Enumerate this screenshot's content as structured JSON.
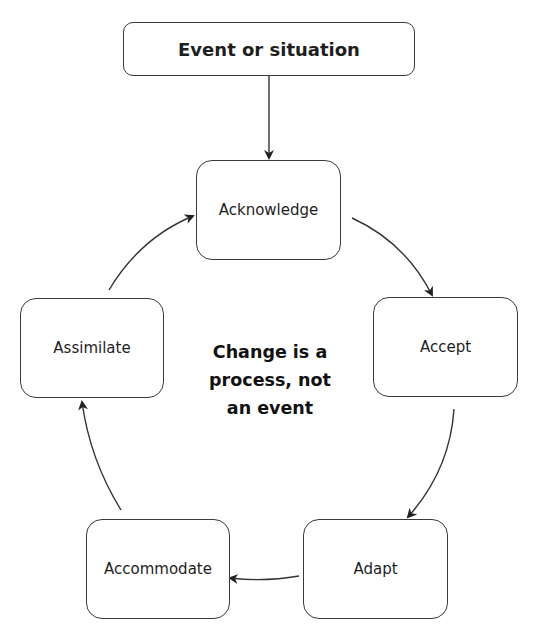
{
  "diagram": {
    "type": "cycle-flow",
    "entry": {
      "label": "Event or situation"
    },
    "stages": [
      {
        "label": "Acknowledge"
      },
      {
        "label": "Accept"
      },
      {
        "label": "Adapt"
      },
      {
        "label": "Accommodate"
      },
      {
        "label": "Assimilate"
      }
    ],
    "center": {
      "lines": [
        "Change is a",
        "process, not",
        "an event"
      ]
    },
    "edges": [
      {
        "from": "Event or situation",
        "to": "Acknowledge"
      },
      {
        "from": "Acknowledge",
        "to": "Accept"
      },
      {
        "from": "Accept",
        "to": "Adapt"
      },
      {
        "from": "Adapt",
        "to": "Accommodate"
      },
      {
        "from": "Accommodate",
        "to": "Assimilate"
      },
      {
        "from": "Assimilate",
        "to": "Acknowledge"
      }
    ],
    "colors": {
      "stroke": "#3a3a3a",
      "text": "#1e1e1e",
      "background": "#ffffff"
    }
  }
}
